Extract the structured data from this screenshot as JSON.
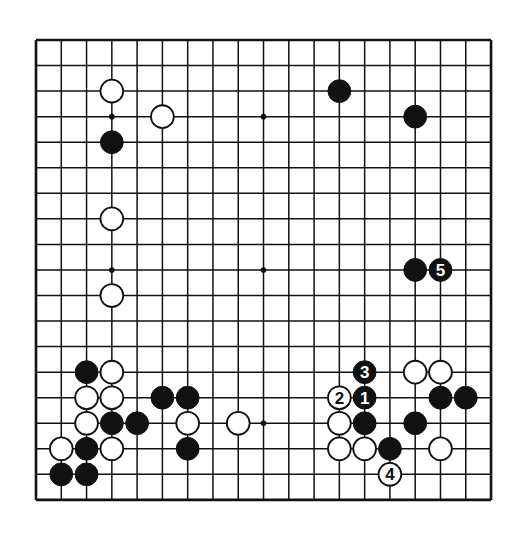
{
  "board": {
    "size": 19,
    "origin": {
      "x": 36,
      "y": 40
    },
    "spacing": {
      "x": 25.28,
      "y": 25.55
    },
    "colors": {
      "background": "#ffffff",
      "line": "#111111",
      "black": "#111111",
      "white": "#ffffff"
    },
    "hoshi": [
      [
        3,
        3
      ],
      [
        9,
        3
      ],
      [
        15,
        3
      ],
      [
        3,
        9
      ],
      [
        9,
        9
      ],
      [
        15,
        9
      ],
      [
        3,
        15
      ],
      [
        9,
        15
      ],
      [
        15,
        15
      ]
    ]
  },
  "stones": [
    {
      "c": 3,
      "r": 2,
      "color": "white"
    },
    {
      "c": 5,
      "r": 3,
      "color": "white"
    },
    {
      "c": 3,
      "r": 4,
      "color": "black"
    },
    {
      "c": 3,
      "r": 7,
      "color": "white"
    },
    {
      "c": 3,
      "r": 10,
      "color": "white"
    },
    {
      "c": 12,
      "r": 2,
      "color": "black"
    },
    {
      "c": 15,
      "r": 3,
      "color": "black"
    },
    {
      "c": 15,
      "r": 9,
      "color": "black"
    },
    {
      "c": 16,
      "r": 9,
      "color": "black",
      "label": "5"
    },
    {
      "c": 2,
      "r": 13,
      "color": "black"
    },
    {
      "c": 3,
      "r": 13,
      "color": "white"
    },
    {
      "c": 2,
      "r": 14,
      "color": "white"
    },
    {
      "c": 3,
      "r": 14,
      "color": "white"
    },
    {
      "c": 5,
      "r": 14,
      "color": "black"
    },
    {
      "c": 6,
      "r": 14,
      "color": "black"
    },
    {
      "c": 2,
      "r": 15,
      "color": "white"
    },
    {
      "c": 3,
      "r": 15,
      "color": "black"
    },
    {
      "c": 4,
      "r": 15,
      "color": "black"
    },
    {
      "c": 6,
      "r": 15,
      "color": "white"
    },
    {
      "c": 8,
      "r": 15,
      "color": "white"
    },
    {
      "c": 1,
      "r": 16,
      "color": "white"
    },
    {
      "c": 2,
      "r": 16,
      "color": "black"
    },
    {
      "c": 3,
      "r": 16,
      "color": "white"
    },
    {
      "c": 6,
      "r": 16,
      "color": "black"
    },
    {
      "c": 1,
      "r": 17,
      "color": "black"
    },
    {
      "c": 2,
      "r": 17,
      "color": "black"
    },
    {
      "c": 13,
      "r": 13,
      "color": "black",
      "label": "3"
    },
    {
      "c": 12,
      "r": 14,
      "color": "white",
      "label": "2"
    },
    {
      "c": 13,
      "r": 14,
      "color": "black",
      "label": "1"
    },
    {
      "c": 12,
      "r": 15,
      "color": "white"
    },
    {
      "c": 13,
      "r": 15,
      "color": "black"
    },
    {
      "c": 12,
      "r": 16,
      "color": "white"
    },
    {
      "c": 13,
      "r": 16,
      "color": "white"
    },
    {
      "c": 14,
      "r": 16,
      "color": "black"
    },
    {
      "c": 14,
      "r": 17,
      "color": "white",
      "label": "4"
    },
    {
      "c": 15,
      "r": 13,
      "color": "white"
    },
    {
      "c": 16,
      "r": 13,
      "color": "white"
    },
    {
      "c": 16,
      "r": 14,
      "color": "black"
    },
    {
      "c": 17,
      "r": 14,
      "color": "black"
    },
    {
      "c": 15,
      "r": 15,
      "color": "black"
    },
    {
      "c": 16,
      "r": 16,
      "color": "white"
    }
  ]
}
